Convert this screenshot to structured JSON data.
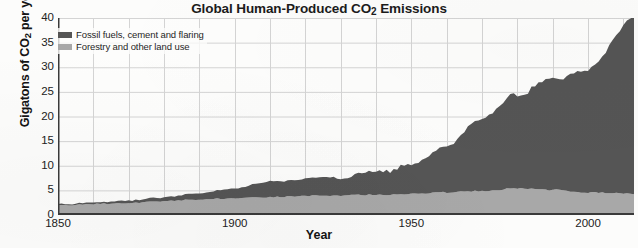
{
  "chart_data": {
    "type": "area",
    "stacked": true,
    "title": "Global Human-Produced CO2 Emissions",
    "title_parts": {
      "before": "Global Human-Produced CO",
      "sub": "2",
      "after": " Emissions"
    },
    "xlabel": "Year",
    "ylabel": "Gigatons of CO2 per year",
    "ylabel_parts": {
      "before": "Gigatons of CO",
      "sub": "2",
      "after": " per year"
    },
    "xlim": [
      1850,
      2013
    ],
    "ylim": [
      0,
      40
    ],
    "yticks": [
      0,
      5,
      10,
      15,
      20,
      25,
      30,
      35,
      40
    ],
    "ytick_labels": [
      "0",
      "5",
      "10",
      "15",
      "20",
      "25",
      "30",
      "35",
      "40"
    ],
    "xticks": [
      1850,
      1900,
      1950,
      2000
    ],
    "xtick_labels": [
      "1850",
      "1900",
      "1950",
      "2000"
    ],
    "grid": "both, every 5 Gt and every 10 years",
    "legend_position": "top-left inside plot",
    "colors": {
      "fossil": "#555555",
      "forestry": "#a8a8a8",
      "grid": "#d4d4d4",
      "axis": "#3a3a3a",
      "background": "#fcfcfb"
    },
    "series": [
      {
        "name": "Fossil fuels, cement and flaring",
        "color": "#555555",
        "stack_order": 2,
        "x": [
          1850,
          1860,
          1870,
          1880,
          1890,
          1900,
          1910,
          1920,
          1930,
          1940,
          1950,
          1960,
          1970,
          1980,
          1990,
          2000,
          2013
        ],
        "values": [
          0.2,
          0.3,
          0.5,
          0.8,
          1.3,
          2.0,
          3.2,
          3.6,
          3.9,
          4.8,
          6.0,
          9.4,
          14.8,
          19.4,
          22.6,
          25.0,
          36.0
        ]
      },
      {
        "name": "Forestry and other land use",
        "color": "#a8a8a8",
        "stack_order": 1,
        "x": [
          1850,
          1860,
          1870,
          1880,
          1890,
          1900,
          1910,
          1920,
          1930,
          1940,
          1950,
          1960,
          1970,
          1980,
          1990,
          2000,
          2013
        ],
        "values": [
          2.0,
          2.2,
          2.4,
          2.8,
          3.2,
          3.4,
          3.6,
          3.9,
          4.0,
          4.1,
          4.3,
          4.6,
          4.9,
          5.4,
          5.1,
          4.6,
          4.3
        ]
      }
    ],
    "totals_note": "Total in 2013 approximately 37 Gt CO2 per year"
  },
  "legend": {
    "items": [
      {
        "label": "Fossil fuels, cement and flaring",
        "color": "#555555"
      },
      {
        "label": "Forestry and other land use",
        "color": "#a8a8a8"
      }
    ]
  }
}
